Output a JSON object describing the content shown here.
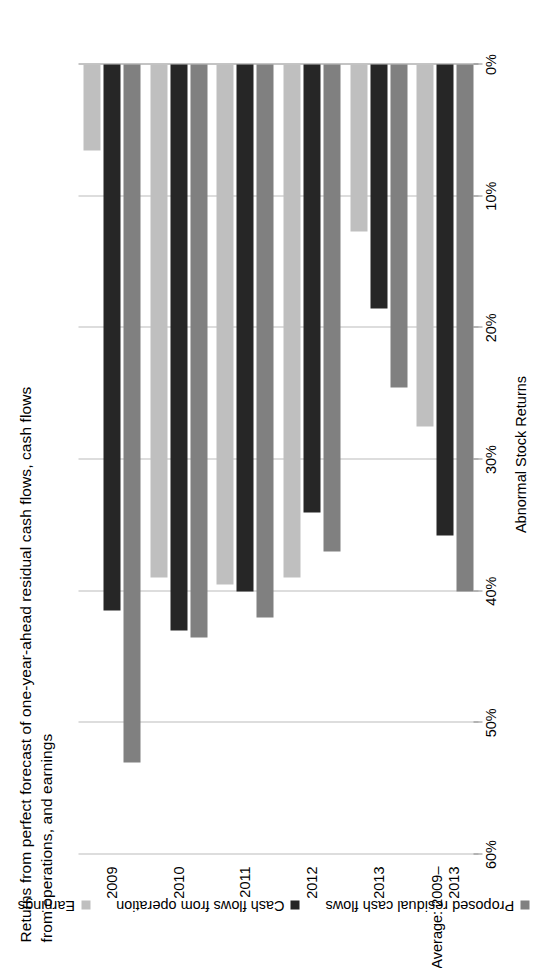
{
  "chart_data": {
    "type": "bar",
    "orientation": "horizontal",
    "title": "Returns from perfect forecast of one-year-ahead residual cash flows, cash flows from operations, and earnings",
    "title_lines": [
      "Returns from perfect forecast of one-year-ahead residual cash flows, cash flows",
      "from operations, and earnings"
    ],
    "xlabel": "",
    "ylabel": "Abnormal Stock Returns",
    "value_axis_title": "Abnormal Stock Returns",
    "categories": [
      "2009",
      "2010",
      "2011",
      "2012",
      "2013",
      "Average: 2009–2013"
    ],
    "category_lines": [
      [
        "2009"
      ],
      [
        "2010"
      ],
      [
        "2011"
      ],
      [
        "2012"
      ],
      [
        "2013"
      ],
      [
        "Average: 2009–",
        "2013"
      ]
    ],
    "tick_labels": [
      "60%",
      "50%",
      "40%",
      "30%",
      "20%",
      "10%",
      "0%"
    ],
    "tick_values": [
      60,
      50,
      40,
      30,
      20,
      10,
      0
    ],
    "ylim": [
      0,
      60
    ],
    "grid": true,
    "legend_position": "bottom",
    "series": [
      {
        "name": "Proposed residual cash flows",
        "color": "#808080",
        "values": [
          53.0,
          43.5,
          42.0,
          37.0,
          24.5,
          40.0
        ]
      },
      {
        "name": "Cash flows from operation",
        "color": "#262626",
        "values": [
          41.5,
          43.0,
          40.0,
          34.0,
          18.5,
          35.8
        ]
      },
      {
        "name": "Earnings",
        "color": "#bfbfbf",
        "values": [
          6.5,
          39.0,
          39.5,
          39.0,
          12.7,
          27.5
        ]
      }
    ]
  }
}
